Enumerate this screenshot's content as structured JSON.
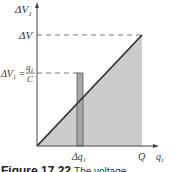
{
  "diagram": {
    "type": "voltage-vs-charge",
    "y_axis_label": "ΔV",
    "y_axis_label_sub": "1",
    "x_axis_label": "q",
    "x_axis_label_sub": "1",
    "level_label": "ΔV",
    "mid_level_label_left": "ΔV",
    "mid_level_label_left_sub": "1",
    "mid_level_equals": "=",
    "mid_level_numerator": "q",
    "mid_level_numerator_sub": "1",
    "mid_level_denominator": "C",
    "strip_label": "Δq",
    "strip_label_sub": "1",
    "x_end_label": "Q",
    "colors": {
      "axis": "#444444",
      "line": "#333333",
      "fill": "#cccccc",
      "strip": "#a8a8a8",
      "dash": "#777777"
    }
  },
  "caption": {
    "figure_number": "Figure 17.22",
    "text": "The voltage"
  }
}
